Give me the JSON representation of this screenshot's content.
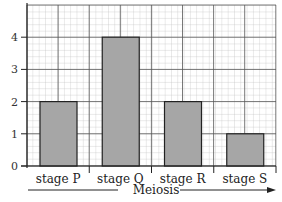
{
  "chart_data": {
    "type": "bar",
    "title": "",
    "xlabel": "Meiosis",
    "ylabel": "",
    "categories": [
      "stage P",
      "stage Q",
      "stage R",
      "stage S"
    ],
    "values": [
      2,
      4,
      2,
      1
    ],
    "ylim": [
      0,
      5
    ],
    "yticks": [
      "0",
      "1",
      "2",
      "3",
      "4"
    ],
    "grid": true,
    "bar_color": "#a6a6a6",
    "annotations": [
      "arrow pointing right under Meiosis"
    ]
  }
}
